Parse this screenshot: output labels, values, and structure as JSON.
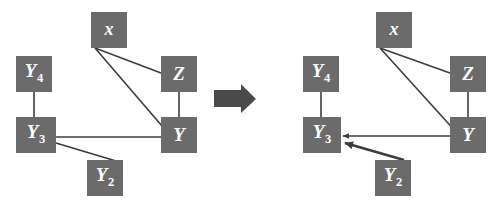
{
  "figure": {
    "type": "causal-graph-transformation",
    "background_color": "#ffffff",
    "node_fill_color": "#6b6b6b",
    "node_text_color": "#ffffff",
    "edge_color": "#3c3c3c",
    "transition_arrow_color": "#4a4a4a",
    "transition_arrow_name": "rightwards-arrow"
  },
  "graphs": [
    {
      "id": "left-graph",
      "name": "undirected-graph",
      "nodes": [
        {
          "id": "x",
          "label": "x",
          "sub": "",
          "x": 91,
          "y": 12,
          "w": 36,
          "h": 36
        },
        {
          "id": "Y4",
          "label": "Y",
          "sub": "4",
          "x": 16,
          "y": 56,
          "w": 36,
          "h": 36
        },
        {
          "id": "Z",
          "label": "Z",
          "sub": "",
          "x": 161,
          "y": 56,
          "w": 36,
          "h": 36
        },
        {
          "id": "Y3",
          "label": "Y",
          "sub": "3",
          "x": 16,
          "y": 117,
          "w": 40,
          "h": 36
        },
        {
          "id": "Y",
          "label": "Y",
          "sub": "",
          "x": 161,
          "y": 117,
          "w": 36,
          "h": 36
        },
        {
          "id": "Y2",
          "label": "Y",
          "sub": "2",
          "x": 87,
          "y": 160,
          "w": 36,
          "h": 36
        }
      ],
      "edges": [
        {
          "from": "x",
          "to": "Z",
          "directed": false,
          "width": 1.6
        },
        {
          "from": "x",
          "to": "Y",
          "directed": false,
          "width": 1.6
        },
        {
          "from": "Y4",
          "to": "Y3",
          "directed": false,
          "width": 1.6
        },
        {
          "from": "Z",
          "to": "Y",
          "directed": false,
          "width": 1.6
        },
        {
          "from": "Y3",
          "to": "Y",
          "directed": false,
          "width": 1.6
        },
        {
          "from": "Y3",
          "to": "Y2",
          "directed": false,
          "width": 1.8
        }
      ]
    },
    {
      "id": "right-graph",
      "name": "partially-directed-graph",
      "nodes": [
        {
          "id": "x",
          "label": "x",
          "sub": "",
          "x": 376,
          "y": 12,
          "w": 36,
          "h": 36
        },
        {
          "id": "Y4",
          "label": "Y",
          "sub": "4",
          "x": 303,
          "y": 56,
          "w": 36,
          "h": 36
        },
        {
          "id": "Z",
          "label": "Z",
          "sub": "",
          "x": 450,
          "y": 56,
          "w": 36,
          "h": 36
        },
        {
          "id": "Y3",
          "label": "Y",
          "sub": "3",
          "x": 303,
          "y": 117,
          "w": 38,
          "h": 36
        },
        {
          "id": "Y",
          "label": "Y",
          "sub": "",
          "x": 450,
          "y": 117,
          "w": 36,
          "h": 36
        },
        {
          "id": "Y2",
          "label": "Y",
          "sub": "2",
          "x": 375,
          "y": 160,
          "w": 36,
          "h": 36
        }
      ],
      "edges": [
        {
          "from": "x",
          "to": "Z",
          "directed": false,
          "width": 1.6
        },
        {
          "from": "x",
          "to": "Y",
          "directed": false,
          "width": 1.6
        },
        {
          "from": "Y4",
          "to": "Y3",
          "directed": false,
          "width": 1.6
        },
        {
          "from": "Z",
          "to": "Y",
          "directed": false,
          "width": 1.6
        },
        {
          "from": "Y",
          "to": "Y3",
          "directed": true,
          "width": 1.6
        },
        {
          "from": "Y2",
          "to": "Y3",
          "directed": true,
          "width": 2.6
        }
      ]
    }
  ],
  "transition": {
    "label": "",
    "x": 214,
    "y": 84,
    "width": 42,
    "height": 30
  }
}
